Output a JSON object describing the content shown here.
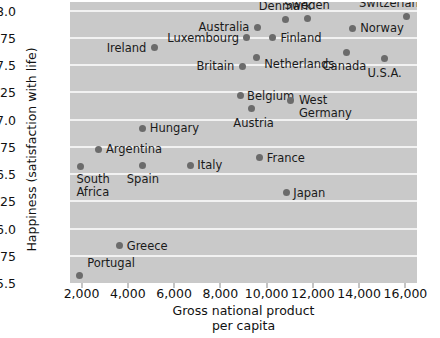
{
  "chart_data": {
    "type": "scatter",
    "title": "",
    "xlabel": "Gross national product\nper capita",
    "ylabel": "Happiness (satisfaction with life)",
    "xlim": [
      1500,
      16500
    ],
    "ylim": [
      5.5,
      8.08
    ],
    "grid": true,
    "legend": "none",
    "xticks": [
      2000,
      4000,
      6000,
      8000,
      10000,
      12000,
      14000,
      16000
    ],
    "xtick_labels": [
      "2,000",
      "4,000",
      "6,000",
      "8,000",
      "10,000",
      "12,000",
      "14,000",
      "16,000"
    ],
    "yticks": [
      5.5,
      5.75,
      6.0,
      6.25,
      6.5,
      6.75,
      7.0,
      7.25,
      7.5,
      7.75,
      8.0
    ],
    "ytick_labels": [
      "5.5",
      "5.75",
      "6.0",
      "6.25",
      "6.5",
      "6.75",
      "7.0",
      "7.25",
      "7.5",
      "7.75",
      "8.0"
    ],
    "plot_background": "#c9c9c9",
    "gridline_color": "#f2f2f2",
    "marker_color": "#6b6b6b",
    "points": [
      {
        "name": "Portugal",
        "x": 1900,
        "y": 5.57,
        "label_pos": "left",
        "label_dx": 8,
        "label_dy": -12
      },
      {
        "name": "Greece",
        "x": 3650,
        "y": 5.84,
        "label_pos": "left",
        "label_dx": 7,
        "label_dy": 0
      },
      {
        "name": "South\nAfrica",
        "x": 1950,
        "y": 6.57,
        "label_pos": "left",
        "label_dx": -4,
        "label_dy": 19
      },
      {
        "name": "Argentina",
        "x": 2750,
        "y": 6.73,
        "label_pos": "left",
        "label_dx": 7,
        "label_dy": 0
      },
      {
        "name": "Spain",
        "x": 4650,
        "y": 6.58,
        "label_pos": "mid",
        "label_dx": 0,
        "label_dy": 14
      },
      {
        "name": "Italy",
        "x": 6700,
        "y": 6.58,
        "label_pos": "left",
        "label_dx": 7,
        "label_dy": 0
      },
      {
        "name": "Hungary",
        "x": 4650,
        "y": 6.92,
        "label_pos": "left",
        "label_dx": 7,
        "label_dy": 0
      },
      {
        "name": "France",
        "x": 9700,
        "y": 6.65,
        "label_pos": "left",
        "label_dx": 7,
        "label_dy": 0
      },
      {
        "name": "Japan",
        "x": 10850,
        "y": 6.33,
        "label_pos": "left",
        "label_dx": 7,
        "label_dy": 0
      },
      {
        "name": "Austria",
        "x": 9350,
        "y": 7.1,
        "label_pos": "mid",
        "label_dx": 2,
        "label_dy": 14
      },
      {
        "name": "Belgium",
        "x": 8850,
        "y": 7.22,
        "label_pos": "left",
        "label_dx": 7,
        "label_dy": 0
      },
      {
        "name": "West\nGermany",
        "x": 11050,
        "y": 7.18,
        "label_pos": "left",
        "label_dx": 8,
        "label_dy": 6
      },
      {
        "name": "Britain",
        "x": 8950,
        "y": 7.49,
        "label_pos": "right",
        "label_dx": -8,
        "label_dy": 0
      },
      {
        "name": "Netherlands",
        "x": 9550,
        "y": 7.57,
        "label_pos": "left",
        "label_dx": 8,
        "label_dy": 6
      },
      {
        "name": "U.S.A.",
        "x": 15100,
        "y": 7.56,
        "label_pos": "mid",
        "label_dx": 0,
        "label_dy": 14
      },
      {
        "name": "Canada",
        "x": 13450,
        "y": 7.62,
        "label_pos": "mid",
        "label_dx": -2,
        "label_dy": 14
      },
      {
        "name": "Ireland",
        "x": 5150,
        "y": 7.66,
        "label_pos": "right",
        "label_dx": -8,
        "label_dy": 0
      },
      {
        "name": "Luxembourg",
        "x": 9150,
        "y": 7.75,
        "label_pos": "right",
        "label_dx": -8,
        "label_dy": 0
      },
      {
        "name": "Finland",
        "x": 10250,
        "y": 7.75,
        "label_pos": "left",
        "label_dx": 8,
        "label_dy": 0
      },
      {
        "name": "Australia",
        "x": 9600,
        "y": 7.85,
        "label_pos": "right",
        "label_dx": -8,
        "label_dy": 0
      },
      {
        "name": "Denmark",
        "x": 10800,
        "y": 7.92,
        "label_pos": "mid",
        "label_dx": 0,
        "label_dy": -13
      },
      {
        "name": "Sweden",
        "x": 11750,
        "y": 7.93,
        "label_pos": "mid",
        "label_dx": 0,
        "label_dy": -13
      },
      {
        "name": "Norway",
        "x": 13700,
        "y": 7.84,
        "label_pos": "left",
        "label_dx": 8,
        "label_dy": 0
      },
      {
        "name": "Switzerland",
        "x": 16050,
        "y": 7.95,
        "label_pos": "mid",
        "label_dx": -14,
        "label_dy": -13
      }
    ]
  }
}
